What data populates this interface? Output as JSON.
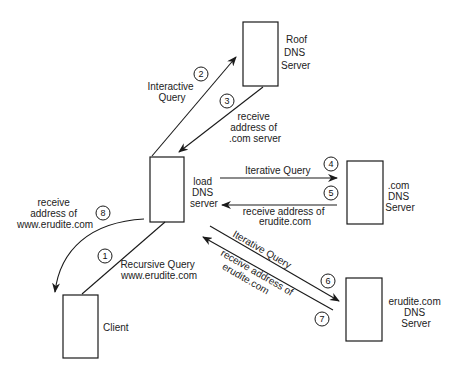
{
  "nodes": {
    "root": {
      "label": [
        "Roof",
        "DNS",
        "Server"
      ]
    },
    "load": {
      "label": [
        "load",
        "DNS",
        "server"
      ]
    },
    "com": {
      "label": [
        ".com",
        "DNS",
        "Server"
      ]
    },
    "erudite": {
      "label": [
        "erudite.com",
        "DNS",
        "Server"
      ]
    },
    "client": {
      "label": [
        "Client"
      ]
    }
  },
  "edges": {
    "e1": {
      "step": "1",
      "label": [
        "Recursive Query",
        "www.erudite.com"
      ]
    },
    "e2": {
      "step": "2",
      "label": [
        "Interactive",
        "Query"
      ]
    },
    "e3": {
      "step": "3",
      "label": [
        "receive",
        "address of",
        ".com server"
      ]
    },
    "e4": {
      "step": "4",
      "label": [
        "Iterative Query"
      ]
    },
    "e5": {
      "step": "5",
      "label": [
        "receive address of",
        "erudite.com"
      ]
    },
    "e6": {
      "step": "6",
      "label": [
        "Iterative Query"
      ]
    },
    "e7": {
      "step": "7",
      "label": [
        "receive address of",
        "erudite.com"
      ]
    },
    "e8": {
      "step": "8",
      "label": [
        "receive",
        "address of",
        "www.erudite.com"
      ]
    }
  },
  "colors": {
    "stroke": "#1a1a1a",
    "text": "#222222",
    "background": "#ffffff"
  }
}
